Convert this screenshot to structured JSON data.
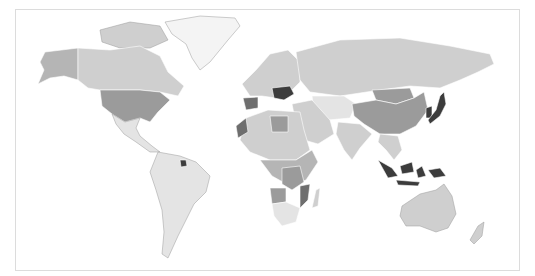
{
  "map": {
    "type": "choropleth-world",
    "projection": "equirectangular-like",
    "background": "#ffffff",
    "frame_color": "#dcdcdc",
    "shades": {
      "none": "#f4f4f4",
      "very_light": "#e4e4e4",
      "light": "#cfcfcf",
      "medium": "#b5b5b5",
      "medium_dark": "#9b9b9b",
      "dark": "#6e6e6e",
      "darkest": "#3c3c3c"
    },
    "regions": [
      {
        "name": "Greenland",
        "shade": "none"
      },
      {
        "name": "Canada",
        "shade": "light"
      },
      {
        "name": "Alaska",
        "shade": "medium"
      },
      {
        "name": "United States",
        "shade": "medium_dark"
      },
      {
        "name": "Mexico / Central America",
        "shade": "very_light"
      },
      {
        "name": "South America",
        "shade": "very_light"
      },
      {
        "name": "French Guiana",
        "shade": "darkest"
      },
      {
        "name": "Europe",
        "shade": "light"
      },
      {
        "name": "Iberia",
        "shade": "dark"
      },
      {
        "name": "Balkans / Hungary region",
        "shade": "darkest"
      },
      {
        "name": "Russia",
        "shade": "light"
      },
      {
        "name": "Central Asia",
        "shade": "very_light"
      },
      {
        "name": "Middle East",
        "shade": "light"
      },
      {
        "name": "China",
        "shade": "medium_dark"
      },
      {
        "name": "Mongolia",
        "shade": "medium_dark"
      },
      {
        "name": "India",
        "shade": "light"
      },
      {
        "name": "Southeast Asia",
        "shade": "light"
      },
      {
        "name": "Japan",
        "shade": "darkest"
      },
      {
        "name": "Korea",
        "shade": "darkest"
      },
      {
        "name": "Indonesia",
        "shade": "darkest"
      },
      {
        "name": "Australia",
        "shade": "light"
      },
      {
        "name": "New Zealand",
        "shade": "light"
      },
      {
        "name": "North Africa",
        "shade": "light"
      },
      {
        "name": "Libya",
        "shade": "medium_dark"
      },
      {
        "name": "Western Sahara / Morocco",
        "shade": "dark"
      },
      {
        "name": "Central Africa",
        "shade": "medium"
      },
      {
        "name": "DR Congo",
        "shade": "medium_dark"
      },
      {
        "name": "Angola",
        "shade": "medium_dark"
      },
      {
        "name": "Mozambique",
        "shade": "dark"
      },
      {
        "name": "Southern Africa",
        "shade": "very_light"
      },
      {
        "name": "Madagascar",
        "shade": "light"
      }
    ]
  }
}
